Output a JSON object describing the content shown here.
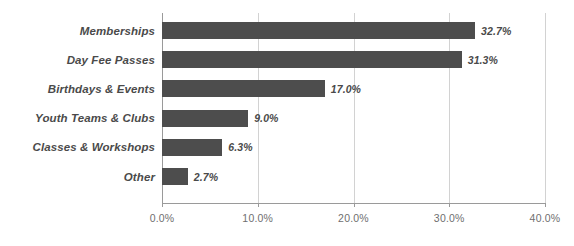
{
  "chart_data": {
    "type": "bar",
    "orientation": "horizontal",
    "title": "",
    "xlabel": "",
    "ylabel": "",
    "xlim": [
      0,
      40
    ],
    "grid": true,
    "legend": false,
    "value_suffix": "%",
    "categories": [
      "Memberships",
      "Day Fee Passes",
      "Birthdays & Events",
      "Youth Teams & Clubs",
      "Classes & Workshops",
      "Other"
    ],
    "values": [
      32.7,
      31.3,
      17.0,
      9.0,
      6.3,
      2.7
    ],
    "data_labels": [
      "32.7%",
      "31.3%",
      "17.0%",
      "9.0%",
      "6.3%",
      "2.7%"
    ],
    "xticks": [
      0,
      10,
      20,
      30,
      40
    ],
    "xtick_labels": [
      "0.0%",
      "10.0%",
      "20.0%",
      "30.0%",
      "40.0%"
    ],
    "colors": {
      "bar": "#4d4d4d",
      "label_text": "#4a4a4a",
      "tick_text": "#6f6f6f",
      "gridline": "#d2d2d2",
      "axis": "#9a9a9a",
      "background": "#ffffff"
    }
  },
  "title_remnant": ""
}
